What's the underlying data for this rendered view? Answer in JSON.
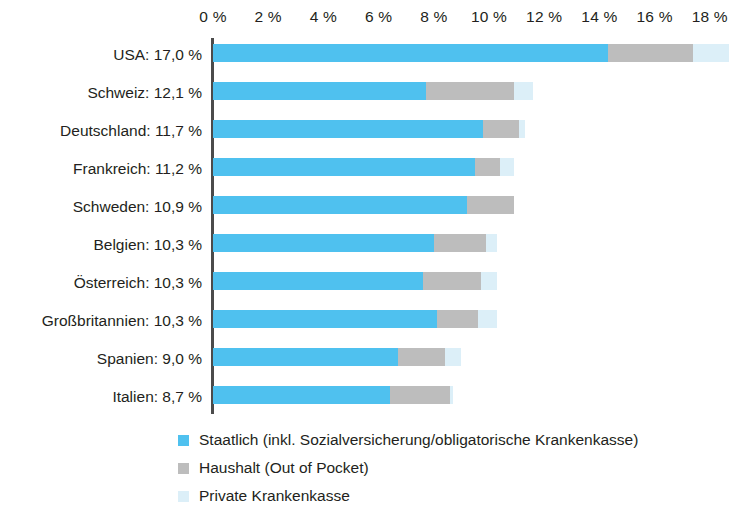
{
  "chart_data": {
    "type": "bar",
    "orientation": "horizontal",
    "stacked": true,
    "title": "",
    "subtitle": "",
    "xlabel": "",
    "ylabel": "",
    "xlim": [
      0,
      18
    ],
    "xtick_step": 2,
    "xticks": [
      "0 %",
      "2 %",
      "4 %",
      "6 %",
      "8 %",
      "10 %",
      "12 %",
      "14 %",
      "16 %",
      "18 %"
    ],
    "xtick_values": [
      0,
      2,
      4,
      6,
      8,
      10,
      12,
      14,
      16,
      18
    ],
    "grid": false,
    "legend_position": "bottom",
    "unit": "%",
    "categories": [
      "USA",
      "Schweiz",
      "Deutschland",
      "Frankreich",
      "Schweden",
      "Belgien",
      "Österreich",
      "Großbritannien",
      "Spanien",
      "Italien"
    ],
    "category_labels": [
      "USA: 17,0 %",
      "Schweiz: 12,1 %",
      "Deutschland: 11,7 %",
      "Frankreich: 11,2 %",
      "Schweden: 10,9 %",
      "Belgien: 10,3 %",
      "Österreich: 10,3 %",
      "Großbritannien: 10,3 %",
      "Spanien: 9,0 %",
      "Italien: 8,7 %"
    ],
    "totals": [
      17.0,
      12.1,
      11.7,
      11.2,
      10.9,
      10.3,
      10.3,
      10.3,
      9.0,
      8.7
    ],
    "series": [
      {
        "name": "Staatlich (inkl. Sozialversicherung/obligatorische Krankenkasse)",
        "color": "#4FC1EF",
        "values": [
          14.3,
          7.7,
          9.8,
          9.5,
          9.2,
          8.0,
          7.6,
          8.1,
          6.7,
          6.4
        ]
      },
      {
        "name": "Haushalt (Out of Pocket)",
        "color": "#BDBDBD",
        "values": [
          3.1,
          3.2,
          1.3,
          0.9,
          1.7,
          1.9,
          2.1,
          1.5,
          1.7,
          2.2
        ]
      },
      {
        "name": "Private Krankenkasse",
        "color": "#DCEFF8",
        "values": [
          1.3,
          0.7,
          0.2,
          0.5,
          0.0,
          0.4,
          0.6,
          0.7,
          0.6,
          0.1
        ]
      }
    ]
  },
  "legend": {
    "items": [
      {
        "label": "Staatlich (inkl. Sozialversicherung/obligatorische Krankenkasse)",
        "color": "#4FC1EF",
        "swatch": "square-swatch-icon"
      },
      {
        "label": "Haushalt (Out of Pocket)",
        "color": "#BDBDBD",
        "swatch": "square-swatch-icon"
      },
      {
        "label": "Private Krankenkasse",
        "color": "#DCEFF8",
        "swatch": "square-swatch-icon"
      }
    ]
  },
  "colors": {
    "staatlich": "#4FC1EF",
    "haushalt": "#BDBDBD",
    "privat": "#DCEFF8",
    "axis": "#4B4B4B",
    "text": "#231F20",
    "background": "#FFFFFF"
  }
}
